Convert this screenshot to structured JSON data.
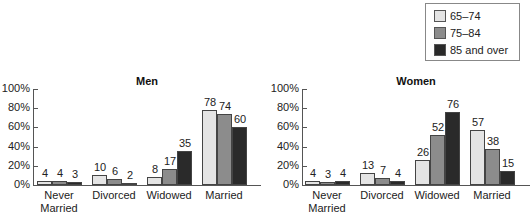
{
  "legend": [
    {
      "label": "65–74",
      "color": "#e4e4e4"
    },
    {
      "label": "75–84",
      "color": "#8c8c8c"
    },
    {
      "label": "85 and over",
      "color": "#2a2a2a"
    }
  ],
  "chart_data": [
    {
      "type": "bar",
      "title": "Men",
      "categories": [
        "Never Married",
        "Divorced",
        "Widowed",
        "Married"
      ],
      "series": [
        {
          "name": "65–74",
          "values": [
            4,
            10,
            8,
            78
          ]
        },
        {
          "name": "75–84",
          "values": [
            4,
            6,
            17,
            74
          ]
        },
        {
          "name": "85 and over",
          "values": [
            3,
            2,
            35,
            60
          ]
        }
      ],
      "yticks": [
        "0%",
        "20%",
        "40%",
        "60%",
        "80%",
        "100%"
      ],
      "ylim": [
        0,
        100
      ],
      "xlabel": "",
      "ylabel": ""
    },
    {
      "type": "bar",
      "title": "Women",
      "categories": [
        "Never Married",
        "Divorced",
        "Widowed",
        "Married"
      ],
      "series": [
        {
          "name": "65–74",
          "values": [
            4,
            13,
            26,
            57
          ]
        },
        {
          "name": "75–84",
          "values": [
            3,
            7,
            52,
            38
          ]
        },
        {
          "name": "85 and over",
          "values": [
            4,
            4,
            76,
            15
          ]
        }
      ],
      "yticks": [
        "0%",
        "20%",
        "40%",
        "60%",
        "80%",
        "100%"
      ],
      "ylim": [
        0,
        100
      ],
      "xlabel": "",
      "ylabel": ""
    }
  ],
  "category_lines": [
    [
      "Never",
      "Married"
    ],
    [
      "Divorced"
    ],
    [
      "Widowed"
    ],
    [
      "Married"
    ]
  ]
}
